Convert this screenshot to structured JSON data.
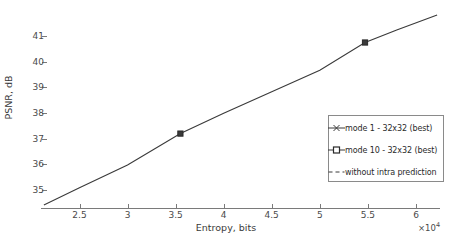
{
  "chart_data": {
    "type": "line",
    "title": "",
    "xlabel": "Entropy, bits",
    "ylabel": "PSNR, dB",
    "x_multiplier": "×10",
    "x_multiplier_exponent": "4",
    "xlim": [
      21000,
      62500
    ],
    "ylim": [
      34.3,
      41.9
    ],
    "xticks": [
      25000,
      30000,
      35000,
      40000,
      45000,
      50000,
      55000,
      60000
    ],
    "xticklabels": [
      "2.5",
      "3",
      "3.5",
      "4",
      "4.5",
      "5",
      "5.5",
      "6"
    ],
    "yticks": [
      35,
      36,
      37,
      38,
      39,
      40,
      41
    ],
    "yticklabels": [
      "35",
      "36",
      "37",
      "38",
      "39",
      "40",
      "41"
    ],
    "grid": false,
    "legend_position": "center right",
    "line_color": "#3a3a3a",
    "series": [
      {
        "name": "mode 1 - 32x32 (best)",
        "marker": "cross",
        "linestyle": "solid",
        "x": [
          21300,
          25000,
          30000,
          35500,
          40000,
          45000,
          50000,
          54700,
          58000,
          62200
        ],
        "y": [
          34.42,
          35.09,
          35.98,
          37.2,
          37.99,
          38.83,
          39.67,
          40.75,
          41.24,
          41.82
        ]
      },
      {
        "name": "mode 10 - 32x32 (best)",
        "marker": "square",
        "linestyle": "solid",
        "x": [
          21300,
          25000,
          30000,
          35500,
          40000,
          45000,
          50000,
          54700,
          58000,
          62200
        ],
        "y": [
          34.42,
          35.09,
          35.98,
          37.2,
          37.99,
          38.83,
          39.67,
          40.75,
          41.24,
          41.82
        ]
      },
      {
        "name": "without intra prediction",
        "marker": "none",
        "linestyle": "dashed",
        "x": [
          21300,
          25000,
          30000,
          35500,
          40000,
          45000,
          50000,
          54700,
          58000,
          62200
        ],
        "y": [
          34.42,
          35.09,
          35.98,
          37.2,
          37.99,
          38.83,
          39.67,
          40.75,
          41.24,
          41.82
        ]
      }
    ],
    "marked_points": [
      {
        "x": 35500,
        "y": 37.2
      },
      {
        "x": 54700,
        "y": 40.75
      }
    ]
  },
  "legend": {
    "entries": [
      {
        "label": "mode 1 - 32x32 (best)",
        "marker": "cross-marker-icon"
      },
      {
        "label": "mode 10 - 32x32 (best)",
        "marker": "square-marker-icon"
      },
      {
        "label": "without intra prediction",
        "marker": "dashed-line-icon"
      }
    ]
  }
}
